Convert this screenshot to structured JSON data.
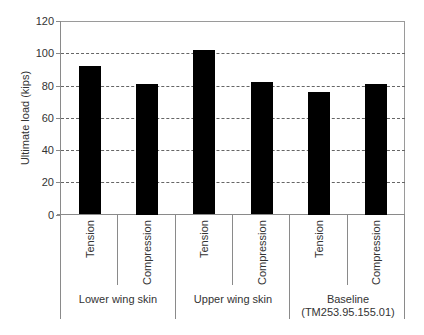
{
  "chart_data": {
    "type": "bar",
    "title": "",
    "xlabel": "",
    "ylabel": "Ultimate load (kips)",
    "ylim": [
      0,
      120
    ],
    "yticks": [
      0,
      20,
      40,
      60,
      80,
      100,
      120
    ],
    "grid": "horizontal dashed",
    "legend": null,
    "groups": [
      {
        "label": "Lower wing skin",
        "categories": [
          "Tension",
          "Compression"
        ],
        "values": [
          92,
          81
        ]
      },
      {
        "label": "Upper wing skin",
        "categories": [
          "Tension",
          "Compression"
        ],
        "values": [
          102,
          82
        ]
      },
      {
        "label": "Baseline\n(TM253.95.155.01)",
        "label_lines": [
          "Baseline",
          "(TM253.95.155.01)"
        ],
        "categories": [
          "Tension",
          "Compression"
        ],
        "values": [
          76,
          81
        ]
      }
    ],
    "categories": [
      "Tension",
      "Compression",
      "Tension",
      "Compression",
      "Tension",
      "Compression"
    ],
    "values": [
      92,
      81,
      102,
      82,
      76,
      81
    ],
    "bar_color": "#000000"
  }
}
